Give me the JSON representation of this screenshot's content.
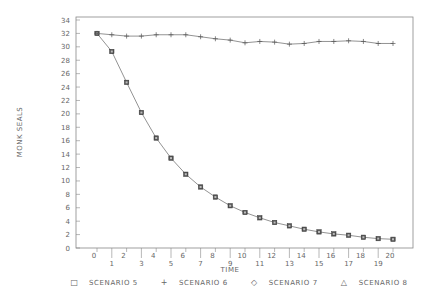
{
  "chart_data": {
    "type": "line",
    "title": "",
    "xlabel": "TIME",
    "ylabel": "MONK SEALS",
    "xlim": [
      -1,
      21
    ],
    "ylim": [
      0,
      34
    ],
    "x": [
      0,
      1,
      2,
      3,
      4,
      5,
      6,
      7,
      8,
      9,
      10,
      11,
      12,
      13,
      14,
      15,
      16,
      17,
      18,
      19,
      20
    ],
    "x_ticks": [
      "0",
      "1",
      "2",
      "3",
      "4",
      "5",
      "6",
      "7",
      "8",
      "9",
      "10",
      "11",
      "12",
      "13",
      "14",
      "15",
      "16",
      "17",
      "18",
      "19",
      "20"
    ],
    "y_ticks": [
      "0",
      "2",
      "4",
      "6",
      "8",
      "10",
      "12",
      "14",
      "16",
      "18",
      "20",
      "22",
      "24",
      "26",
      "28",
      "30",
      "32",
      "34"
    ],
    "grid": false,
    "legend_position": "bottom",
    "series": [
      {
        "name": "SCENARIO 5",
        "marker": "square",
        "values": [
          32,
          29.3,
          24.7,
          20.2,
          16.4,
          13.4,
          11.0,
          9.1,
          7.6,
          6.3,
          5.3,
          4.5,
          3.8,
          3.3,
          2.8,
          2.4,
          2.1,
          1.9,
          1.6,
          1.4,
          1.3
        ]
      },
      {
        "name": "SCENARIO 6",
        "marker": "plus",
        "values": [
          32,
          31.8,
          31.6,
          31.6,
          31.8,
          31.8,
          31.8,
          31.5,
          31.2,
          31.0,
          30.6,
          30.8,
          30.7,
          30.4,
          30.5,
          30.8,
          30.8,
          30.9,
          30.8,
          30.5,
          30.5
        ]
      },
      {
        "name": "SCENARIO 7",
        "marker": "diamond",
        "values": [
          32,
          29.3,
          24.7,
          20.2,
          16.4,
          13.4,
          11.0,
          9.1,
          7.6,
          6.3,
          5.3,
          4.5,
          3.8,
          3.3,
          2.8,
          2.4,
          2.1,
          1.9,
          1.6,
          1.4,
          1.3
        ]
      },
      {
        "name": "SCENARIO 8",
        "marker": "triangle",
        "values": [
          32,
          29.3,
          24.7,
          20.2,
          16.4,
          13.4,
          11.0,
          9.1,
          7.6,
          6.3,
          5.3,
          4.5,
          3.8,
          3.3,
          2.8,
          2.4,
          2.1,
          1.9,
          1.6,
          1.4,
          1.3
        ]
      }
    ]
  },
  "legend": {
    "items": [
      {
        "symbol": "□",
        "label": "SCENARIO 5"
      },
      {
        "symbol": "+",
        "label": "SCENARIO 6"
      },
      {
        "symbol": "◇",
        "label": "SCENARIO 7"
      },
      {
        "symbol": "△",
        "label": "SCENARIO 8"
      }
    ]
  }
}
